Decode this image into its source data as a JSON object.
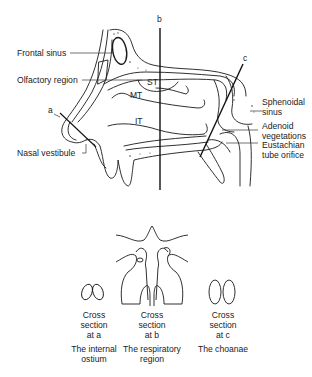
{
  "diagram": {
    "section_lines": [
      {
        "id": "a",
        "label": "a"
      },
      {
        "id": "b",
        "label": "b"
      },
      {
        "id": "c",
        "label": "c"
      }
    ],
    "structures": {
      "superior_turbinate": "ST",
      "middle_turbinate": "MT",
      "inferior_turbinate": "IT"
    },
    "left_labels": {
      "frontal_sinus": "Frontal sinus",
      "olfactory_region": "Olfactory region",
      "nasal_vestibule": "Nasal vestibule"
    },
    "right_labels": {
      "sphenoidal_sinus": "Sphenoidal\nsinus",
      "adenoid_vegetations": "Adenoid\nvegetations",
      "eustachian_tube_orifice": "Eustachian\ntube orifice"
    },
    "cross_sections": [
      {
        "caption": "Cross\nsection\nat a",
        "name": "The internal\nostium"
      },
      {
        "caption": "Cross\nsection\nat b",
        "name": "The respiratory\nregion"
      },
      {
        "caption": "Cross\nsection\nat c",
        "name": "The choanae"
      }
    ]
  },
  "colors": {
    "line": "#1a1a1a",
    "background": "#ffffff"
  }
}
